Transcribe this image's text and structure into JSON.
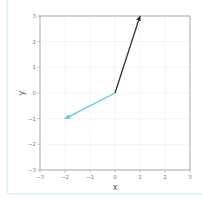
{
  "chart_data": {
    "type": "vector",
    "title": "",
    "xlabel": "x",
    "ylabel": "y",
    "xlim": [
      -3,
      3
    ],
    "ylim": [
      -3,
      3
    ],
    "grid": true,
    "xticks": [
      -3,
      -2,
      -1,
      0,
      1,
      2,
      3
    ],
    "yticks": [
      -3,
      -2,
      -1,
      0,
      1,
      2,
      3
    ],
    "xtick_labels": [
      "−3",
      "−2",
      "−1",
      "0",
      "1",
      "2",
      "3"
    ],
    "ytick_labels": [
      "−3",
      "−2",
      "−1",
      "0",
      "1",
      "2",
      "3"
    ],
    "series": [
      {
        "name": "vector-1",
        "origin": [
          0,
          0
        ],
        "end": [
          1,
          3
        ],
        "color": "#333333"
      },
      {
        "name": "vector-2",
        "origin": [
          0,
          0
        ],
        "end": [
          -2,
          -1
        ],
        "color": "#5bc8e6"
      }
    ]
  },
  "colors": {
    "frame_border": "#e3f4fb",
    "grid": "#eeeeee",
    "axes": "#999999"
  }
}
